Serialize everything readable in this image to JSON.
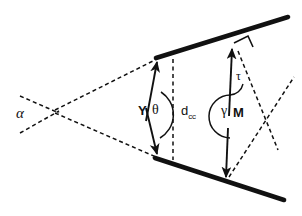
{
  "figure": {
    "type": "line-diagram",
    "background": "#ffffff",
    "stroke_color": "#111111",
    "width": 302,
    "height": 216
  },
  "labels": {
    "alpha": "α",
    "Y": "Y",
    "theta": "θ",
    "d_base": "d",
    "d_sub": "cc",
    "gamma": "γ",
    "M": "M",
    "tau": "τ"
  },
  "geometry": {
    "thick_lines": [
      {
        "name": "upper-boundary-line",
        "x1": 156,
        "y1": 58,
        "x2": 288,
        "y2": 17,
        "width": 4.6
      },
      {
        "name": "lower-boundary-line",
        "x1": 155,
        "y1": 158,
        "x2": 284,
        "y2": 200,
        "width": 4.6
      }
    ],
    "solid_vectors": [
      {
        "name": "Y-vector-upper",
        "x1": 148,
        "y1": 120,
        "x2": 158,
        "y2": 62,
        "arrow": true
      },
      {
        "name": "Y-vector-lower",
        "x1": 148,
        "y1": 108,
        "x2": 158,
        "y2": 155,
        "arrow": true
      },
      {
        "name": "M-vector-upper",
        "x1": 229,
        "y1": 115,
        "x2": 231,
        "y2": 48,
        "arrow": true
      },
      {
        "name": "M-vector-lower",
        "x1": 228,
        "y1": 127,
        "x2": 226,
        "y2": 178,
        "arrow": true
      }
    ],
    "dashed_lines": [
      {
        "name": "alpha-upper-ray",
        "x1": 20,
        "y1": 96,
        "x2": 57,
        "y2": 112
      },
      {
        "name": "alpha-lower-ray",
        "x1": 20,
        "y1": 133,
        "x2": 57,
        "y2": 112
      },
      {
        "name": "convergence-upper",
        "x1": 57,
        "y1": 112,
        "x2": 157,
        "y2": 60
      },
      {
        "name": "convergence-lower",
        "x1": 57,
        "y1": 112,
        "x2": 156,
        "y2": 157
      },
      {
        "name": "d-cc-vertical",
        "x1": 173,
        "y1": 58,
        "x2": 173,
        "y2": 160
      },
      {
        "name": "normal-dashed-upper",
        "x1": 239,
        "y1": 52,
        "x2": 276,
        "y2": 148
      },
      {
        "name": "normal-dashed-lower",
        "x1": 231,
        "y1": 176,
        "x2": 292,
        "y2": 78
      }
    ],
    "angle_arcs": [
      {
        "name": "theta-arc",
        "cx": 150,
        "cy": 114,
        "r": 26,
        "from_deg": -72,
        "to_deg": 62
      },
      {
        "name": "gamma-arc",
        "cx": 232,
        "cy": 116,
        "r": 22,
        "from_deg": 96,
        "to_deg": 268
      },
      {
        "name": "tau-arc",
        "cx": 232,
        "cy": 88,
        "r": 14,
        "from_deg": -62,
        "to_deg": 14
      }
    ],
    "right_angle_marker": {
      "name": "right-angle-marker",
      "points": "235,42 247,36 252,47"
    }
  }
}
